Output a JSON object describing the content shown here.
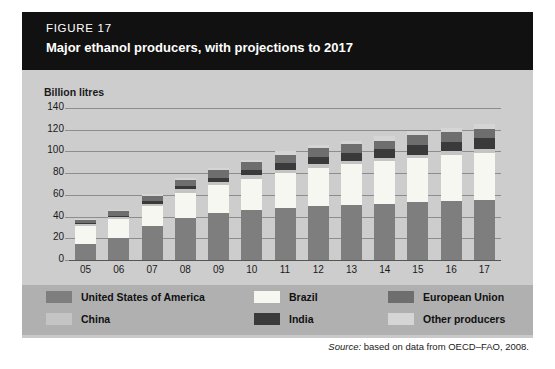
{
  "figure": {
    "label": "FIGURE 17",
    "title": "Major ethanol producers, with projections to 2017",
    "source": "Source: based on data from OECD–FAO, 2008.",
    "source_prefix": "Source:",
    "source_rest": " based on data from OECD–FAO, 2008."
  },
  "legend": {
    "items": [
      {
        "label": "United States of America",
        "color": "#7e7e7e",
        "key": "usa"
      },
      {
        "label": "Brazil",
        "color": "#f7f7f2",
        "key": "brazil"
      },
      {
        "label": "European Union",
        "color": "#6e6e6e",
        "key": "eu"
      },
      {
        "label": "China",
        "color": "#c4c4c4",
        "key": "china"
      },
      {
        "label": "India",
        "color": "#3a3a3a",
        "key": "india"
      },
      {
        "label": "Other producers",
        "color": "#d5d5d5",
        "key": "other"
      }
    ]
  },
  "chart_data": {
    "type": "bar",
    "stacked": true,
    "title": "Major ethanol producers, with projections to 2017",
    "xlabel": "",
    "ylabel": "Billion litres",
    "ylim": [
      0,
      140
    ],
    "yticks": [
      0,
      20,
      40,
      60,
      80,
      100,
      120,
      140
    ],
    "grid": true,
    "legend_position": "bottom",
    "categories": [
      "05",
      "06",
      "07",
      "08",
      "09",
      "10",
      "11",
      "12",
      "13",
      "14",
      "15",
      "16",
      "17"
    ],
    "series": [
      {
        "name": "United States of America",
        "color": "#7e7e7e",
        "values": [
          15,
          20,
          31,
          39,
          43,
          46,
          48,
          50,
          51,
          52,
          53,
          54,
          55
        ]
      },
      {
        "name": "Brazil",
        "color": "#f7f7f2",
        "values": [
          16,
          18,
          19,
          23,
          26,
          29,
          32,
          35,
          37,
          39,
          41,
          43,
          44
        ]
      },
      {
        "name": "China",
        "color": "#c4c4c4",
        "values": [
          2,
          2,
          2,
          3,
          3,
          3,
          3,
          3,
          3,
          3,
          3,
          3,
          3
        ]
      },
      {
        "name": "India",
        "color": "#3a3a3a",
        "values": [
          1,
          1,
          2,
          3,
          4,
          5,
          6,
          7,
          8,
          8,
          9,
          9,
          10
        ]
      },
      {
        "name": "European Union",
        "color": "#6e6e6e",
        "values": [
          3,
          4,
          5,
          6,
          7,
          7,
          8,
          8,
          8,
          8,
          9,
          9,
          9
        ]
      },
      {
        "name": "Other producers",
        "color": "#d5d5d5",
        "values": [
          1,
          1,
          2,
          2,
          2,
          2,
          3,
          3,
          3,
          4,
          4,
          4,
          4
        ]
      }
    ],
    "totals": [
      38,
      46,
      61,
      76,
      85,
      92,
      100,
      106,
      110,
      114,
      119,
      122,
      125
    ]
  }
}
